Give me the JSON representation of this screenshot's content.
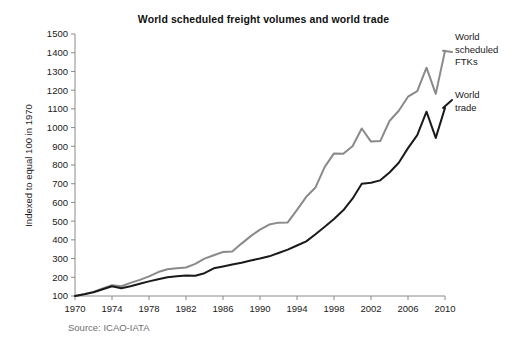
{
  "chart_data": {
    "type": "line",
    "title": "World scheduled freight volumes and world trade",
    "xlabel": "",
    "ylabel": "Indexed to equal 100 in 1970",
    "source": "Source: ICAO-IATA",
    "grid": false,
    "legend_position": "right-inline-annotations",
    "xlim": [
      1970,
      2010
    ],
    "ylim": [
      100,
      1500
    ],
    "ytick_values": [
      100,
      200,
      300,
      400,
      500,
      600,
      700,
      800,
      900,
      1000,
      1100,
      1200,
      1300,
      1400,
      1500
    ],
    "ytick_labels": [
      "100",
      "200",
      "300",
      "400",
      "500",
      "600",
      "700",
      "800",
      "900",
      "1000",
      "1100",
      "1200",
      "1300",
      "1400",
      "1500"
    ],
    "xtick_values": [
      1970,
      1974,
      1978,
      1982,
      1986,
      1990,
      1994,
      1998,
      2002,
      2006,
      2010
    ],
    "xtick_labels": [
      "1970",
      "1974",
      "1978",
      "1982",
      "1986",
      "1990",
      "1994",
      "1998",
      "2002",
      "2006",
      "2010"
    ],
    "x": [
      1970,
      1971,
      1972,
      1973,
      1974,
      1975,
      1976,
      1977,
      1978,
      1979,
      1980,
      1981,
      1982,
      1983,
      1984,
      1985,
      1986,
      1987,
      1988,
      1989,
      1990,
      1991,
      1992,
      1993,
      1994,
      1995,
      1996,
      1997,
      1998,
      1999,
      2000,
      2001,
      2002,
      2003,
      2004,
      2005,
      2006,
      2007,
      2008,
      2009,
      2010
    ],
    "series": [
      {
        "name": "World scheduled FTKs",
        "color": "#8a8a8a",
        "label_text": "World\nscheduled\nFTKs",
        "values": [
          100,
          110,
          122,
          140,
          158,
          152,
          170,
          186,
          205,
          228,
          243,
          248,
          252,
          272,
          300,
          318,
          335,
          338,
          380,
          420,
          455,
          482,
          492,
          493,
          560,
          630,
          680,
          790,
          862,
          860,
          900,
          995,
          925,
          928,
          1035,
          1090,
          1165,
          1195,
          1320,
          1180,
          1410
        ]
      },
      {
        "name": "World trade",
        "color": "#1a1a1a",
        "label_text": "World\ntrade",
        "values": [
          100,
          109,
          120,
          136,
          152,
          141,
          152,
          165,
          178,
          190,
          200,
          206,
          210,
          208,
          222,
          248,
          258,
          268,
          278,
          290,
          300,
          312,
          330,
          348,
          370,
          392,
          430,
          470,
          512,
          558,
          620,
          700,
          705,
          718,
          760,
          812,
          890,
          960,
          1085,
          945,
          1105
        ]
      }
    ]
  },
  "figure": {
    "title": "World scheduled freight volumes and world trade",
    "ylabel": "Indexed to equal 100 in 1970",
    "source": "Source: ICAO-IATA",
    "legend": {
      "ftk": "World\nscheduled\nFTKs",
      "trade": "World\ntrade"
    }
  }
}
